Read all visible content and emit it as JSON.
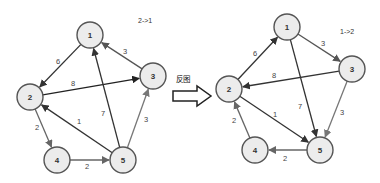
{
  "transform": {
    "label": "反图",
    "arrow_icon": "hollow-right-arrow"
  },
  "graphs": [
    {
      "id": "original",
      "caption": "2->1",
      "caption_pos": [
        138,
        23
      ],
      "nodes": [
        {
          "id": "1",
          "label": "1",
          "x": 90,
          "y": 35
        },
        {
          "id": "2",
          "label": "2",
          "x": 30,
          "y": 97
        },
        {
          "id": "3",
          "label": "3",
          "x": 153,
          "y": 76
        },
        {
          "id": "4",
          "label": "4",
          "x": 57,
          "y": 160
        },
        {
          "id": "5",
          "label": "5",
          "x": 123,
          "y": 160
        }
      ],
      "edges": [
        {
          "from": "1",
          "to": "2",
          "weight": "6",
          "label_pos": [
            58,
            61
          ],
          "color": "#333333"
        },
        {
          "from": "2",
          "to": "3",
          "weight": "8",
          "label_pos": [
            73,
            83
          ],
          "color": "#222222"
        },
        {
          "from": "3",
          "to": "1",
          "weight": "3",
          "label_pos": [
            125,
            51
          ],
          "color": "#555555"
        },
        {
          "from": "5",
          "to": "1",
          "weight": "7",
          "label_pos": [
            103,
            113
          ],
          "color": "#333333"
        },
        {
          "from": "5",
          "to": "2",
          "weight": "1",
          "label_pos": [
            79,
            121
          ],
          "color": "#333333"
        },
        {
          "from": "2",
          "to": "4",
          "weight": "2",
          "label_pos": [
            37,
            127
          ],
          "color": "#666666"
        },
        {
          "from": "4",
          "to": "5",
          "weight": "2",
          "label_pos": [
            87,
            166
          ],
          "color": "#666666"
        },
        {
          "from": "5",
          "to": "3",
          "weight": "3",
          "label_pos": [
            146,
            119
          ],
          "color": "#777777"
        }
      ]
    },
    {
      "id": "reversed",
      "caption": "1->2",
      "caption_pos": [
        340,
        34
      ],
      "nodes": [
        {
          "id": "1",
          "label": "1",
          "x": 287,
          "y": 27
        },
        {
          "id": "2",
          "label": "2",
          "x": 229,
          "y": 89
        },
        {
          "id": "3",
          "label": "3",
          "x": 352,
          "y": 69
        },
        {
          "id": "4",
          "label": "4",
          "x": 255,
          "y": 150
        },
        {
          "id": "5",
          "label": "5",
          "x": 320,
          "y": 150
        }
      ],
      "edges": [
        {
          "from": "2",
          "to": "1",
          "weight": "6",
          "label_pos": [
            255,
            53
          ],
          "color": "#333333"
        },
        {
          "from": "3",
          "to": "2",
          "weight": "8",
          "label_pos": [
            274,
            75
          ],
          "color": "#333333"
        },
        {
          "from": "1",
          "to": "3",
          "weight": "3",
          "label_pos": [
            323,
            43
          ],
          "color": "#555555"
        },
        {
          "from": "1",
          "to": "5",
          "weight": "7",
          "label_pos": [
            300,
            106
          ],
          "color": "#333333"
        },
        {
          "from": "2",
          "to": "5",
          "weight": "1",
          "label_pos": [
            275,
            114
          ],
          "color": "#333333"
        },
        {
          "from": "4",
          "to": "2",
          "weight": "2",
          "label_pos": [
            234,
            120
          ],
          "color": "#666666"
        },
        {
          "from": "5",
          "to": "4",
          "weight": "2",
          "label_pos": [
            285,
            158
          ],
          "color": "#666666"
        },
        {
          "from": "3",
          "to": "5",
          "weight": "3",
          "label_pos": [
            342,
            112
          ],
          "color": "#777777"
        }
      ]
    }
  ],
  "style": {
    "node_radius": 13,
    "node_fill": "#ececec",
    "node_stroke": "#555555"
  }
}
